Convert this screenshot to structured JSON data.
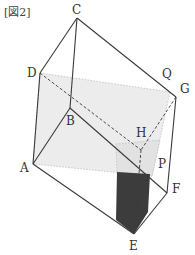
{
  "figure": {
    "title": "[図2]",
    "vertices": {
      "A": {
        "label": "A",
        "x": 33,
        "y": 164
      },
      "B": {
        "label": "B",
        "x": 70,
        "y": 108
      },
      "C": {
        "label": "C",
        "x": 77,
        "y": 18
      },
      "D": {
        "label": "D",
        "x": 40,
        "y": 73
      },
      "E": {
        "label": "E",
        "x": 134,
        "y": 234
      },
      "F": {
        "label": "F",
        "x": 167,
        "y": 193
      },
      "G": {
        "label": "G",
        "x": 176,
        "y": 97
      },
      "H": {
        "label": "H",
        "x": 141,
        "y": 150
      },
      "P": {
        "label": "P",
        "x": 155,
        "y": 180
      },
      "Q": {
        "label": "Q",
        "x": 168,
        "y": 88
      }
    },
    "colors": {
      "edge": "#3a3a3a",
      "plane_fill": "#e6e6e6",
      "shaded_fill": "#3c3c3c"
    }
  }
}
